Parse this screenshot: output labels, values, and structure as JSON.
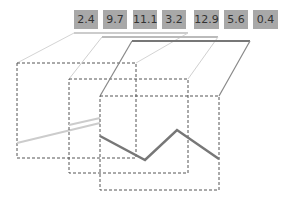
{
  "values": [
    "2.4",
    "9.7",
    "11.1",
    "3.2",
    "12.9",
    "5.6",
    "0.4"
  ],
  "cells": [
    {
      "x": 74,
      "w": 24
    },
    {
      "x": 103,
      "w": 24
    },
    {
      "x": 133,
      "w": 24
    },
    {
      "x": 162,
      "w": 24
    },
    {
      "x": 194,
      "w": 25
    },
    {
      "x": 224,
      "w": 24
    },
    {
      "x": 253,
      "w": 25
    }
  ],
  "colors": {
    "cell": "#a8a8a8",
    "back_line": "#cccccc",
    "mid_line": "#bbbbbb",
    "front_line": "#777777",
    "box_border": "#555555"
  },
  "frames": [
    {
      "name": "back",
      "box": [
        17,
        63,
        136,
        158
      ],
      "top": [
        74,
        33,
        188,
        33
      ],
      "line": [
        [
          17,
          143
        ],
        [
          136,
          118
        ]
      ]
    },
    {
      "name": "middle",
      "box": [
        69,
        79,
        188,
        173
      ],
      "top": [
        102,
        37,
        218,
        37
      ],
      "line": [
        [
          69,
          125
        ],
        [
          100,
          118
        ]
      ]
    },
    {
      "name": "front",
      "box": [
        100,
        96,
        219,
        190
      ],
      "top": [
        132,
        41,
        250,
        41
      ],
      "line": [
        [
          100,
          136
        ],
        [
          145,
          160
        ],
        [
          177,
          130
        ],
        [
          219,
          159
        ]
      ]
    }
  ]
}
